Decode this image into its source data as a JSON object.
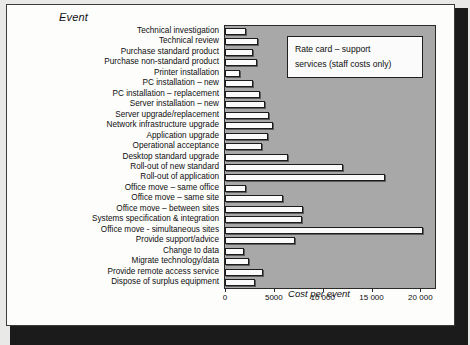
{
  "chart_data": {
    "type": "bar",
    "orientation": "horizontal",
    "title": "",
    "axis_title": "Event",
    "xlabel": "Cost per event",
    "ylabel": "Event",
    "xlim": [
      0,
      21500
    ],
    "xticks": [
      0,
      5000,
      10000,
      15000,
      20000
    ],
    "xticklabels": [
      "0",
      "5000",
      "10 000",
      "15 000",
      "20 000"
    ],
    "grid": false,
    "legend": false,
    "plot_background": "#a8a8a8",
    "bar_color": "#fbfbfb",
    "bar_edge_color": "#1c1c1c",
    "annotation": {
      "line1": "Rate card – support",
      "line2": "services (staff costs only)"
    },
    "categories": [
      "Technical investigation",
      "Technical review",
      "Purchase standard product",
      "Purchase non-standard product",
      "Printer installation",
      "PC installation – new",
      "PC installation – replacement",
      "Server installation – new",
      "Server upgrade/replacement",
      "Network infrastructure upgrade",
      "Application upgrade",
      "Operational acceptance",
      "Desktop standard upgrade",
      "Roll-out of new standard",
      "Roll-out of application",
      "Office move – same office",
      "Office move – same site",
      "Office move – between sites",
      "Systems specification & integration",
      "Office move - simultaneous sites",
      "Provide support/advice",
      "Change to data",
      "Migrate technology/data",
      "Provide remote access service",
      "Dispose of surplus equipment"
    ],
    "values": [
      2200,
      3350,
      2850,
      3250,
      1500,
      2850,
      3550,
      4050,
      4500,
      4900,
      4400,
      3800,
      6400,
      12100,
      16400,
      2100,
      5900,
      7950,
      7850,
      20300,
      7150,
      1950,
      2450,
      3850,
      3050
    ]
  }
}
